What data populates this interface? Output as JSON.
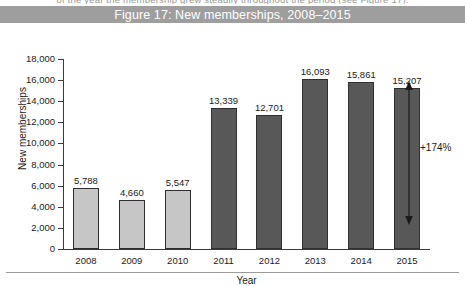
{
  "page": {
    "top_cut_text": "of the  year  the  membership  grew  steadily  throughout  the  period  (see  Figure  17)."
  },
  "figure": {
    "title": "Figure 17: New memberships, 2008–2015"
  },
  "chart_data": {
    "type": "bar",
    "title": "Figure 17: New memberships, 2008–2015",
    "xlabel": "Year",
    "ylabel": "New memberships",
    "categories": [
      "2008",
      "2009",
      "2010",
      "2011",
      "2012",
      "2013",
      "2014",
      "2015"
    ],
    "values": [
      5788,
      4660,
      5547,
      13339,
      12701,
      16093,
      15861,
      15207
    ],
    "value_labels": [
      "5,788",
      "4,660",
      "5,547",
      "13,339",
      "12,701",
      "16,093",
      "15,861",
      "15,207"
    ],
    "bar_colors": [
      "#c6c6c6",
      "#c6c6c6",
      "#c6c6c6",
      "#585858",
      "#585858",
      "#585858",
      "#585858",
      "#585858"
    ],
    "ylim": [
      0,
      18000
    ],
    "ytick_values": [
      18000,
      16000,
      14000,
      12000,
      10000,
      8000,
      6000,
      4000,
      2000,
      0
    ],
    "ytick_labels": [
      "18,000",
      "16,000",
      "14,000",
      "12,000",
      "10,000",
      "8,000",
      "6,000",
      "4,000",
      "2,000",
      "0"
    ],
    "grid": false,
    "legend": null,
    "annotations": [
      {
        "text": "+174%",
        "type": "double-headed-arrow",
        "from_category": "2008",
        "to_category": "2015"
      }
    ]
  },
  "colors": {
    "title_bar": "#9e9e9e",
    "title_text": "#ffffff",
    "bar_light": "#c6c6c6",
    "bar_dark": "#585858",
    "axis": "#3b3b3b"
  }
}
